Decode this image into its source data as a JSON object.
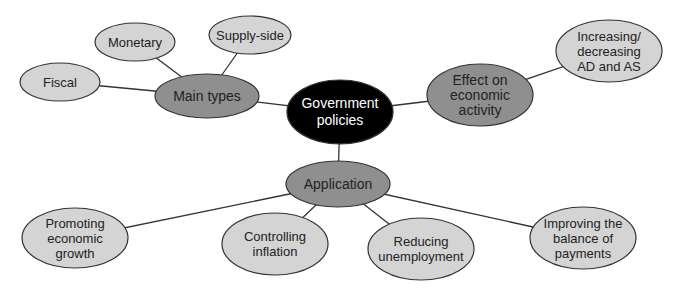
{
  "diagram": {
    "colors": {
      "center_fill": "#000000",
      "center_text": "#ffffff",
      "branch_fill": "#8f8f8f",
      "leaf_fill": "#d4d4d4",
      "stroke": "#333333",
      "background": "#ffffff"
    },
    "center": {
      "id": "government-policies",
      "lines": [
        "Government",
        "policies"
      ],
      "cx": 340,
      "cy": 112,
      "rx": 53,
      "ry": 32
    },
    "branches": [
      {
        "id": "main-types",
        "lines": [
          "Main types"
        ],
        "cx": 207,
        "cy": 96,
        "rx": 52,
        "ry": 22,
        "children": [
          {
            "id": "fiscal",
            "lines": [
              "Fiscal"
            ],
            "cx": 60,
            "cy": 82,
            "rx": 40,
            "ry": 19
          },
          {
            "id": "monetary",
            "lines": [
              "Monetary"
            ],
            "cx": 135,
            "cy": 42,
            "rx": 40,
            "ry": 19
          },
          {
            "id": "supply-side",
            "lines": [
              "Supply-side"
            ],
            "cx": 250,
            "cy": 35,
            "rx": 41,
            "ry": 19
          }
        ]
      },
      {
        "id": "effect-on-economic-activity",
        "lines": [
          "Effect on",
          "economic",
          "activity"
        ],
        "cx": 480,
        "cy": 95,
        "rx": 53,
        "ry": 31,
        "children": [
          {
            "id": "increasing-decreasing-ad-as",
            "lines": [
              "Increasing/",
              "decreasing",
              "AD and AS"
            ],
            "cx": 609,
            "cy": 51,
            "rx": 53,
            "ry": 31
          }
        ]
      },
      {
        "id": "application",
        "lines": [
          "Application"
        ],
        "cx": 338,
        "cy": 184,
        "rx": 52,
        "ry": 23,
        "children": [
          {
            "id": "promoting-economic-growth",
            "lines": [
              "Promoting",
              "economic",
              "growth"
            ],
            "cx": 75,
            "cy": 238,
            "rx": 53,
            "ry": 30
          },
          {
            "id": "controlling-inflation",
            "lines": [
              "Controlling",
              "inflation"
            ],
            "cx": 275,
            "cy": 244,
            "rx": 53,
            "ry": 31
          },
          {
            "id": "reducing-unemployment",
            "lines": [
              "Reducing",
              "unemployment"
            ],
            "cx": 421,
            "cy": 249,
            "rx": 53,
            "ry": 31
          },
          {
            "id": "improving-balance-of-payments",
            "lines": [
              "Improving the",
              "balance of",
              "payments"
            ],
            "cx": 583,
            "cy": 238,
            "rx": 53,
            "ry": 31
          }
        ]
      }
    ]
  }
}
